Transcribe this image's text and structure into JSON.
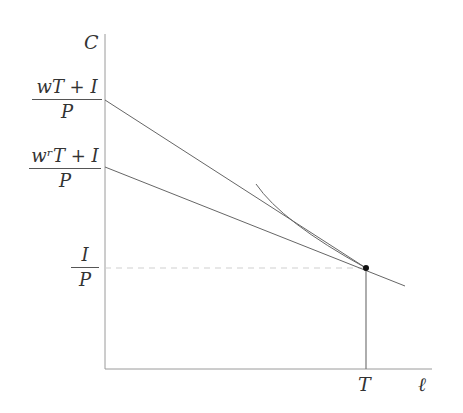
{
  "diagram": {
    "axes": {
      "y_label": "C",
      "x_label": "ℓ",
      "x_tick": "T"
    },
    "intercepts": [
      {
        "name": "high-wage-intercept",
        "numerator": "wT + I",
        "denominator": "P"
      },
      {
        "name": "reservation-wage-intercept",
        "numerator": "wʳT + I",
        "denominator": "P"
      },
      {
        "name": "nonlabor-income-intercept",
        "numerator": "I",
        "denominator": "P"
      }
    ],
    "colors": {
      "axis": "#999999",
      "line": "#666666",
      "dashed": "#cccccc",
      "point": "#111111"
    }
  }
}
